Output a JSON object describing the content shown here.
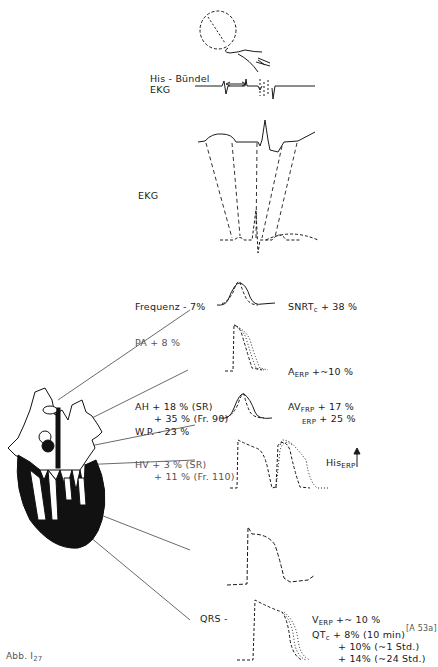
{
  "figure": {
    "caption": "Abb. I",
    "caption_sub": "27",
    "reference": "[A 53a]"
  },
  "top": {
    "his_label_1": "His - Bündel",
    "his_label_2": "EKG",
    "ekg_label": "EKG"
  },
  "left_labels": {
    "frequenz": "Frequenz - 7%",
    "pa": "PA + 8 %",
    "ah_1": "AH + 18 % (SR)",
    "ah_2": "+ 35 % (Fr. 90)",
    "wp": "W.P. - 23 %",
    "hv_1": "HV +  3 % (SR)",
    "hv_2": "+ 11 % (Fr. 110)",
    "qrs": "QRS -"
  },
  "right_labels": {
    "snrt_main": "SNRT",
    "snrt_sub": "c",
    "snrt_val": " + 38 %",
    "aerp_main": "A",
    "aerp_sub": "ERP",
    "aerp_val": " +~10 %",
    "av_main": "AV",
    "av_sub": "FRP",
    "av_val": " + 17 %",
    "av2_sub": "ERP",
    "av2_val": " + 25 %",
    "his_main": "His",
    "his_sub": "ERP",
    "verp_main": "V",
    "verp_sub": "ERP",
    "verp_val": " +~ 10 %",
    "qtc_main": "QT",
    "qtc_sub": "c",
    "qtc_1": " +  8% (10 min)",
    "qtc_2": "+ 10% (~1 Std.)",
    "qtc_3": "+ 14% (~24 Std.)"
  },
  "colors": {
    "ink": "#1a1a1a",
    "gray_ink": "#555555",
    "background": "#ffffff"
  }
}
